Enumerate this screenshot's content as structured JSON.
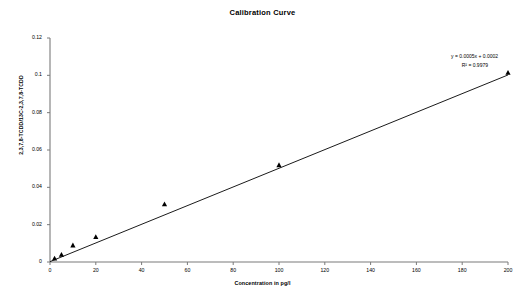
{
  "chart_data": {
    "type": "scatter",
    "title": "Calibration Curve",
    "xlabel": "Concentration in pg/l",
    "ylabel": "2,3,7,8-TCDD/13C-2,3,7,8-TCDD",
    "xlim": [
      0,
      200
    ],
    "ylim": [
      0,
      0.12
    ],
    "xticks": [
      "0",
      "20",
      "40",
      "60",
      "80",
      "100",
      "120",
      "140",
      "160",
      "180",
      "200"
    ],
    "xtick_values": [
      0,
      20,
      40,
      60,
      80,
      100,
      120,
      140,
      160,
      180,
      200
    ],
    "yticks": [
      "0",
      "0.02",
      "0.04",
      "0.06",
      "0.08",
      "0.1",
      "0.12"
    ],
    "ytick_values": [
      0,
      0.02,
      0.04,
      0.06,
      0.08,
      0.1,
      0.12
    ],
    "grid": false,
    "legend": false,
    "marker": "triangle",
    "marker_color": "#000000",
    "line_color": "#000000",
    "series": [
      {
        "name": "Calibration points",
        "x": [
          2,
          5,
          10,
          20,
          50,
          100,
          200
        ],
        "values": [
          0.002,
          0.004,
          0.009,
          0.0135,
          0.031,
          0.052,
          0.1015
        ]
      }
    ],
    "trendline": {
      "type": "linear",
      "slope": 0.0005,
      "intercept": 0.0002,
      "r_squared": 0.9979
    },
    "annotations": {
      "equation": "y = 0.0005x + 0.0002",
      "r_squared": "R² = 0.9979"
    }
  }
}
